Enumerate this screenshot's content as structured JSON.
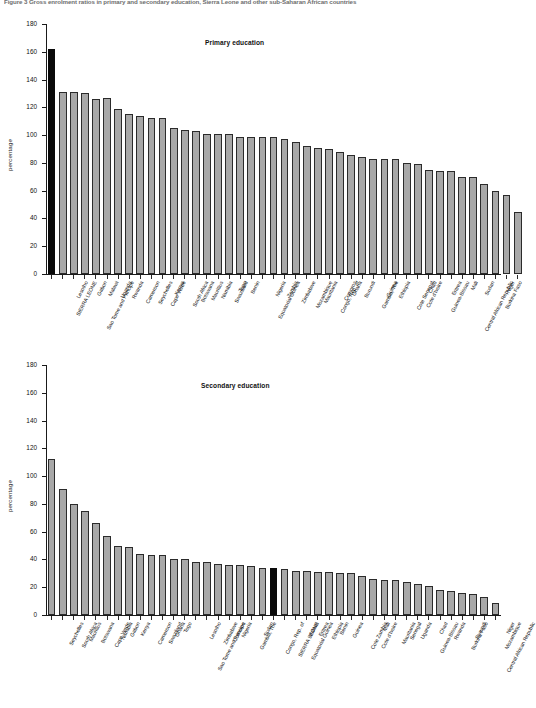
{
  "figure": {
    "caption": "Figure 3  Gross enrolment ratios in primary and secondary education, Sierra Leone and other sub-Saharan African countries",
    "ylabel": "percentage",
    "yticks": [
      0,
      20,
      40,
      60,
      80,
      100,
      120,
      140,
      160,
      180
    ],
    "highlight_country": "SIERRA LEONE",
    "colors": {
      "bar_fill": "#a8a8a8",
      "bar_border": "#2b2b2b",
      "highlight_fill": "#0a0a0a",
      "axis": "#1a1a1a"
    }
  },
  "chart_data": [
    {
      "type": "bar",
      "title": "Primary education",
      "xlabel": "",
      "ylabel": "percentage",
      "ylim": [
        0,
        180
      ],
      "yticks": [
        0,
        20,
        40,
        60,
        80,
        100,
        120,
        140,
        160,
        180
      ],
      "grid": false,
      "legend": "none",
      "highlight": [
        "SIERRA LEONE"
      ],
      "categories": [
        "SIERRA LEONE",
        "Lesotho",
        "Sao Tome and Principe",
        "Gabon",
        "Malawi",
        "Uganda",
        "Rwanda",
        "Cameroon",
        "Seychelles",
        "Cape Verde",
        "Kenya",
        "South Africa",
        "Botswana",
        "Mauritius",
        "Namibia",
        "Swaziland",
        "Togo",
        "Benin",
        "Equatorial Guinea",
        "Nigeria",
        "Zambia",
        "Zimbabwe",
        "Mozambique",
        "Mauritania",
        "Congo, Rep. of",
        "Comoros",
        "Ghana",
        "Burundi",
        "Gambia, The",
        "Guinea",
        "Ethiopia",
        "Cote Senegal",
        "Cote d'Ivoire",
        "Chad",
        "Guinea-Bissau",
        "Eritrea",
        "Central African Republic",
        "Mali",
        "Sudan",
        "Burkina Faso",
        "Niger"
      ],
      "values": [
        162,
        131,
        131,
        130,
        126,
        127,
        119,
        115,
        114,
        112,
        112,
        105,
        104,
        103,
        101,
        101,
        101,
        99,
        99,
        99,
        99,
        97,
        95,
        92,
        91,
        90,
        88,
        86,
        84,
        83,
        83,
        83,
        80,
        79,
        75,
        74,
        74,
        70,
        70,
        65,
        60,
        57,
        45
      ],
      "first_value": 162,
      "last_value": 45
    },
    {
      "type": "bar",
      "title": "Secondary education",
      "xlabel": "",
      "ylabel": "percentage",
      "ylim": [
        0,
        180
      ],
      "yticks": [
        0,
        20,
        40,
        60,
        80,
        100,
        120,
        140,
        160,
        180
      ],
      "grid": false,
      "legend": "none",
      "highlight": [
        "SIERRA LEONE"
      ],
      "categories": [
        "Seychelles",
        "South Africa",
        "Mauritius",
        "Botswana",
        "Cape Verde",
        "Namibia",
        "Gabon",
        "Kenya",
        "Cameroon",
        "Swaziland",
        "Ghana",
        "Togo",
        "Sao Tome and Principe",
        "Lesotho",
        "Zimbabwe",
        "Comoros",
        "Nigeria",
        "Gambia, The",
        "Sudan",
        "Congo, Rep. of",
        "SIERRA LEONE",
        "Equatorial Guinea",
        "Malawi",
        "Eritrea",
        "Ethiopia",
        "Benin",
        "Guinea",
        "Cote Zambia",
        "Cote d'Ivoire",
        "Mali",
        "Mauritania",
        "Senegal",
        "Uganda",
        "Guinea-Bissau",
        "Chad",
        "Rwanda",
        "Burkina Faso",
        "Burundi",
        "Central African Republic",
        "Mozambique",
        "Niger"
      ],
      "values": [
        112,
        91,
        80,
        75,
        66,
        57,
        50,
        49,
        44,
        43,
        43,
        40,
        40,
        38,
        38,
        37,
        36,
        36,
        35,
        34,
        34,
        33,
        32,
        32,
        31,
        31,
        30,
        30,
        28,
        26,
        25,
        25,
        24,
        22,
        21,
        18,
        17,
        16,
        15,
        13,
        9
      ],
      "first_value": 112,
      "last_value": 9
    }
  ]
}
